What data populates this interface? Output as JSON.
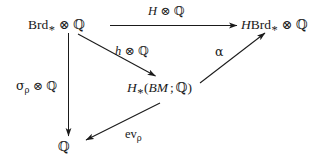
{
  "diagram": {
    "kind": "commutative-diagram",
    "width": 320,
    "height": 165,
    "background_color": "#ffffff",
    "ink_color": "#1a1a1a",
    "nodes": [
      {
        "id": "brd",
        "label": "Brd_* ⊗ ℚ",
        "parts": {
          "name": "Brd",
          "star": "*",
          "tensor": "⊗",
          "ring": "ℚ"
        }
      },
      {
        "id": "hbrd",
        "label": "HBrd_* ⊗ ℚ",
        "parts": {
          "h": "H",
          "name": "Brd",
          "star": "*",
          "tensor": "⊗",
          "ring": "ℚ"
        }
      },
      {
        "id": "hbm",
        "label": "H_*(BM ; ℚ)",
        "parts": {
          "h": "H",
          "star": "*",
          "open": "(",
          "space": "BM",
          "semicolon": ";",
          "ring": "ℚ",
          "close": ")"
        }
      },
      {
        "id": "q-bottom",
        "label": "ℚ",
        "parts": {
          "ring": "ℚ"
        }
      }
    ],
    "edges": [
      {
        "id": "brd-to-hbrd",
        "from": "brd",
        "to": "hbrd",
        "label": "H ⊗ ℚ",
        "parts": {
          "h": "H",
          "tensor": "⊗",
          "ring": "ℚ"
        }
      },
      {
        "id": "brd-to-hbm",
        "from": "brd",
        "to": "hbm",
        "label": "h ⊗ ℚ",
        "parts": {
          "h": "h",
          "tensor": "⊗",
          "ring": "ℚ"
        }
      },
      {
        "id": "hbm-to-hbrd",
        "from": "hbm",
        "to": "hbrd",
        "label": "α",
        "parts": {
          "alpha": "α"
        }
      },
      {
        "id": "brd-to-q",
        "from": "brd",
        "to": "q-bottom",
        "label": "σ_ρ ⊗ ℚ",
        "parts": {
          "sigma": "σ",
          "rho": "ρ",
          "tensor": "⊗",
          "ring": "ℚ"
        }
      },
      {
        "id": "hbm-to-q",
        "from": "hbm",
        "to": "q-bottom",
        "label": "ev_ρ",
        "parts": {
          "ev": "ev",
          "rho": "ρ"
        }
      }
    ]
  }
}
